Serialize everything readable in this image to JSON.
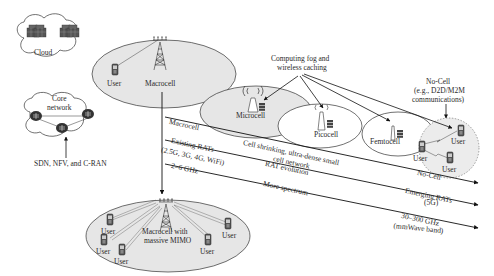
{
  "diagram": {
    "clouds": {
      "cloud": {
        "label": "Cloud"
      },
      "core": {
        "label_line1": "Core",
        "label_line2": "network"
      },
      "sdn_label": "SDN, NFV, and C-RAN"
    },
    "macrocell_top": {
      "user_label": "User",
      "tower_label": "Macrocell"
    },
    "fog_label_line1": "Computing fog and",
    "fog_label_line2": "wireless caching",
    "microcell_label": "Microcell",
    "picocell_label": "Picocell",
    "femtocell_label": "Femtocell",
    "nocell": {
      "title_line1": "No-Cell",
      "title_line2": "(e.g., D2D/M2M",
      "title_line3": "communications)",
      "users": [
        "User",
        "User",
        "User"
      ]
    },
    "trends": [
      {
        "start": "Macrocell",
        "middle_line1": "Cell shrinking, ultra-dense small",
        "middle_line2": "cell network",
        "end": "No-Cell"
      },
      {
        "start_line1": "Existing RATs",
        "start_line2": "(2.5G, 3G, 4G, WiFi)",
        "middle": "RAT evolution",
        "end_line1": "Emerging RATs",
        "end_line2": "(5G)"
      },
      {
        "start": "2–6 GHz",
        "middle": "More spectrum",
        "end_line1": "30–300 GHz",
        "end_line2": "(mmWave band)"
      }
    ],
    "mimo": {
      "tower_label_line1": "Macrocell with",
      "tower_label_line2": "massive MIMO",
      "users": [
        "User",
        "User",
        "User",
        "User",
        "User"
      ]
    },
    "colors": {
      "cell_fill": "#e6e6e6",
      "nocell_fill": "#ececec",
      "stroke": "#222222",
      "icon": "#444444"
    }
  }
}
